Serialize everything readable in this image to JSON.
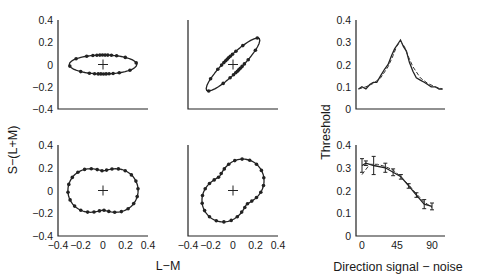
{
  "figure": {
    "y_label_left": "S−(L+M)",
    "x_label_left": "L−M",
    "y_label_right": "Threshold",
    "x_label_right": "Direction signal − noise"
  },
  "chart_data": [
    {
      "type": "line",
      "panel": "top-left",
      "title": "",
      "xlabel": "",
      "ylabel": "S−(L+M)",
      "xlim": [
        -0.4,
        0.4
      ],
      "ylim": [
        -0.4,
        0.4
      ],
      "yticks": [
        "0.4",
        "0.2",
        "0",
        "−0.2",
        "−0.4"
      ],
      "xticks": [],
      "shape": "horizontal ellipse",
      "series": [
        {
          "name": "threshold contour",
          "rx": 0.3,
          "ry": 0.085,
          "rotation_deg": 0,
          "n_points": 24
        }
      ]
    },
    {
      "type": "line",
      "panel": "top-middle",
      "xlim": [
        -0.4,
        0.4
      ],
      "ylim": [
        -0.4,
        0.4
      ],
      "yticks": [],
      "xticks": [],
      "shape": "oblique ellipse",
      "series": [
        {
          "name": "threshold contour",
          "rx": 0.33,
          "ry": 0.07,
          "rotation_deg": 45,
          "n_points": 24
        }
      ]
    },
    {
      "type": "line",
      "panel": "bottom-left",
      "xlim": [
        -0.4,
        0.4
      ],
      "ylim": [
        -0.4,
        0.4
      ],
      "yticks": [
        "0.4",
        "0.2",
        "0",
        "−0.2",
        "−0.4"
      ],
      "xticks": [
        "−0.4",
        "−0.2",
        "0",
        "0.2",
        "0.4"
      ],
      "xlabel": "L−M",
      "shape": "peanut (horizontal)",
      "series": [
        {
          "name": "threshold contour",
          "a": 0.22,
          "b": 0.1,
          "rotation_deg": 0,
          "n_points": 28
        }
      ]
    },
    {
      "type": "line",
      "panel": "bottom-middle",
      "xlim": [
        -0.4,
        0.4
      ],
      "ylim": [
        -0.4,
        0.4
      ],
      "yticks": [],
      "xticks": [
        "−0.4",
        "−0.2",
        "0",
        "0.2",
        "0.4"
      ],
      "xlabel": "L−M",
      "shape": "peanut (oblique)",
      "series": [
        {
          "name": "threshold contour",
          "a": 0.22,
          "b": 0.1,
          "rotation_deg": 45,
          "n_points": 28
        }
      ]
    },
    {
      "type": "line",
      "panel": "top-right",
      "ylabel": "Threshold",
      "xlim": [
        -90,
        90
      ],
      "ylim": [
        0,
        0.4
      ],
      "yticks": [
        "0.4",
        "0.3",
        "0.2",
        "0.1",
        "0"
      ],
      "xticks": [],
      "series": [
        {
          "name": "data",
          "style": "solid",
          "x": [
            -85,
            -78,
            -70,
            -62,
            -55,
            -48,
            -40,
            -32,
            -25,
            -18,
            -12,
            -6,
            0,
            6,
            12,
            18,
            25,
            32,
            40,
            48,
            55,
            62,
            70,
            78,
            85
          ],
          "y": [
            0.09,
            0.1,
            0.09,
            0.11,
            0.12,
            0.12,
            0.15,
            0.18,
            0.2,
            0.24,
            0.27,
            0.29,
            0.31,
            0.28,
            0.26,
            0.21,
            0.17,
            0.14,
            0.13,
            0.12,
            0.11,
            0.1,
            0.1,
            0.09,
            0.09
          ]
        },
        {
          "name": "model fit",
          "style": "dashed",
          "x": [
            -85,
            -70,
            -55,
            -40,
            -25,
            -15,
            -8,
            0,
            8,
            15,
            25,
            40,
            55,
            70,
            85
          ],
          "y": [
            0.09,
            0.1,
            0.115,
            0.14,
            0.19,
            0.24,
            0.28,
            0.305,
            0.28,
            0.24,
            0.19,
            0.14,
            0.115,
            0.1,
            0.09
          ]
        }
      ]
    },
    {
      "type": "line",
      "panel": "bottom-right",
      "ylabel": "Threshold",
      "xlabel": "Direction signal − noise",
      "xlim": [
        -8,
        105
      ],
      "ylim": [
        0,
        0.4
      ],
      "yticks": [
        "0.4",
        "0.3",
        "0.2",
        "0.1",
        "0"
      ],
      "xticks": [
        "0",
        "45",
        "90"
      ],
      "series": [
        {
          "name": "data",
          "style": "solid",
          "x": [
            0,
            5,
            15,
            30,
            40,
            50,
            60,
            70,
            80,
            90
          ],
          "y": [
            0.31,
            0.32,
            0.31,
            0.3,
            0.28,
            0.26,
            0.22,
            0.18,
            0.14,
            0.13
          ],
          "err": [
            0.03,
            0.01,
            0.04,
            0.02,
            0.015,
            0.01,
            0.01,
            0.01,
            0.02,
            0.015
          ]
        },
        {
          "name": "model fit",
          "style": "dashed",
          "x": [
            0,
            10,
            20,
            30,
            40,
            50,
            60,
            70,
            80,
            90
          ],
          "y": [
            0.27,
            0.315,
            0.315,
            0.305,
            0.29,
            0.26,
            0.225,
            0.185,
            0.15,
            0.125
          ]
        }
      ]
    }
  ]
}
